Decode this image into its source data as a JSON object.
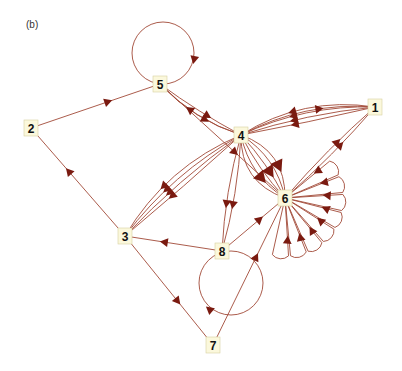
{
  "panel_label": "(b)",
  "colors": {
    "edge": "#a24a38",
    "arrow": "#7a1a10",
    "node_fill": "#fbf8dc"
  },
  "nodes": [
    {
      "id": "1",
      "label": "1",
      "x": 375,
      "y": 107
    },
    {
      "id": "2",
      "label": "2",
      "x": 31,
      "y": 128
    },
    {
      "id": "3",
      "label": "3",
      "x": 125,
      "y": 236
    },
    {
      "id": "4",
      "label": "4",
      "x": 241,
      "y": 135
    },
    {
      "id": "5",
      "label": "5",
      "x": 160,
      "y": 84
    },
    {
      "id": "6",
      "label": "6",
      "x": 285,
      "y": 198
    },
    {
      "id": "7",
      "label": "7",
      "x": 213,
      "y": 345
    },
    {
      "id": "8",
      "label": "8",
      "x": 222,
      "y": 251
    }
  ],
  "edges": [
    {
      "from": "2",
      "to": "5",
      "count": 1
    },
    {
      "from": "3",
      "to": "2",
      "count": 1
    },
    {
      "from": "3",
      "to": "7",
      "count": 1
    },
    {
      "from": "5",
      "to": "5",
      "count": 1,
      "self_loop": true
    },
    {
      "from": "5",
      "to": "4",
      "count": 2
    },
    {
      "from": "4",
      "to": "5",
      "count": 1
    },
    {
      "from": "4",
      "to": "1",
      "count": 1
    },
    {
      "from": "1",
      "to": "4",
      "count": 4
    },
    {
      "from": "4",
      "to": "6",
      "count": 6
    },
    {
      "from": "5",
      "to": "6",
      "count": 1
    },
    {
      "from": "4",
      "to": "3",
      "count": 4
    },
    {
      "from": "4",
      "to": "8",
      "count": 2
    },
    {
      "from": "8",
      "to": "3",
      "count": 1
    },
    {
      "from": "8",
      "to": "6",
      "count": 1
    },
    {
      "from": "8",
      "to": "8",
      "count": 1,
      "self_loop": true
    },
    {
      "from": "7",
      "to": "6",
      "count": 1
    },
    {
      "from": "6",
      "to": "1",
      "count": 2
    },
    {
      "from": "6",
      "to": "6",
      "count": 8,
      "self_loop": true
    }
  ]
}
